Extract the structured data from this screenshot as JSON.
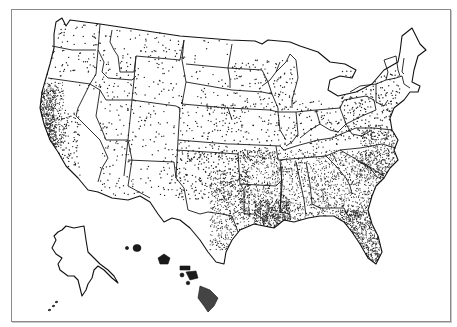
{
  "map": {
    "type": "dot-density map",
    "subject": "United States",
    "frame": {
      "x": 11,
      "y": 9,
      "width": 438,
      "height": 311,
      "border_color": "#8a8a8a"
    },
    "colors": {
      "background": "#ffffff",
      "outline": "#1a1a1a",
      "dot": "#222222"
    },
    "regions_shown": [
      "contiguous United States",
      "Alaska (inset)",
      "Hawaii (inset)"
    ],
    "dot_density": {
      "description": "Each dot represents a fixed count; density is highest along the Pacific coast (California), the Gulf Coast (Louisiana, Texas coast), Florida, and the Southeast; lowest in the Mountain West and Northern Plains.",
      "zones": [
        {
          "name": "california-coast",
          "level": "very-high"
        },
        {
          "name": "florida",
          "level": "very-high"
        },
        {
          "name": "louisiana-gulf",
          "level": "very-high"
        },
        {
          "name": "southeast",
          "level": "high"
        },
        {
          "name": "east-texas",
          "level": "high"
        },
        {
          "name": "mid-atlantic",
          "level": "medium"
        },
        {
          "name": "midwest",
          "level": "low-medium"
        },
        {
          "name": "mountain-west",
          "level": "low"
        },
        {
          "name": "northern-plains",
          "level": "very-low"
        }
      ]
    },
    "text_labels": []
  }
}
